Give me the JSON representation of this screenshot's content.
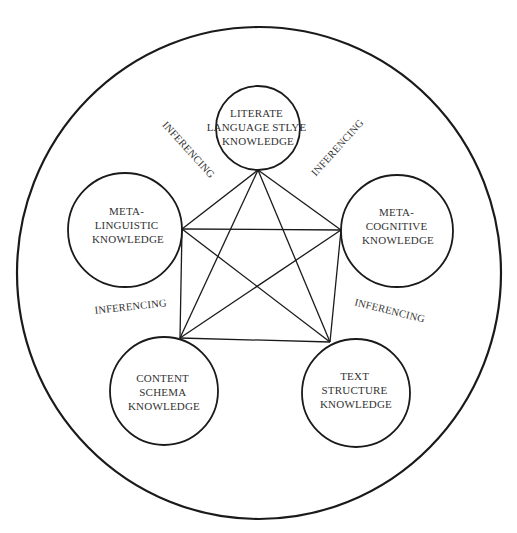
{
  "diagram": {
    "type": "concept-map",
    "nodes": [
      {
        "id": "literate",
        "lines": [
          "LITERATE",
          "LANGUAGE STLYE",
          "KNOWLEDGE"
        ]
      },
      {
        "id": "metalinguistic",
        "lines": [
          "META-",
          "LINGUISTIC",
          "KNOWLEDGE"
        ]
      },
      {
        "id": "metacognitive",
        "lines": [
          "META-",
          "COGNITIVE",
          "KNOWLEDGE"
        ]
      },
      {
        "id": "content-schema",
        "lines": [
          "CONTENT",
          "SCHEMA",
          "KNOWLEDGE"
        ]
      },
      {
        "id": "text-structure",
        "lines": [
          "TEXT",
          "STRUCTURE",
          "KNOWLEDGE"
        ]
      }
    ],
    "edges": [
      [
        "literate",
        "metalinguistic"
      ],
      [
        "literate",
        "metacognitive"
      ],
      [
        "literate",
        "content-schema"
      ],
      [
        "literate",
        "text-structure"
      ],
      [
        "metalinguistic",
        "metacognitive"
      ],
      [
        "metalinguistic",
        "content-schema"
      ],
      [
        "metalinguistic",
        "text-structure"
      ],
      [
        "metacognitive",
        "content-schema"
      ],
      [
        "metacognitive",
        "text-structure"
      ],
      [
        "content-schema",
        "text-structure"
      ]
    ],
    "edge_labels": [
      {
        "id": "upper-left",
        "text": "INFERENCING"
      },
      {
        "id": "upper-right",
        "text": "INFERENCING"
      },
      {
        "id": "lower-left",
        "text": "INFERENCING"
      },
      {
        "id": "lower-right",
        "text": "INFERENCING"
      }
    ],
    "colors": {
      "stroke": "#1a1a1a",
      "text": "#333333",
      "background": "#ffffff"
    }
  }
}
